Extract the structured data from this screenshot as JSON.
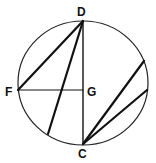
{
  "diagram": {
    "type": "circle-geometry",
    "circle": {
      "cx": 83,
      "cy": 83,
      "rx": 65,
      "ry": 62,
      "stroke": "#222222"
    },
    "points": {
      "D": {
        "x": 83,
        "y": 21,
        "label": "D",
        "lx": 77,
        "ly": 16
      },
      "F": {
        "x": 18,
        "y": 90,
        "label": "F",
        "lx": 5,
        "ly": 96
      },
      "G": {
        "x": 83,
        "y": 90,
        "label": "G",
        "lx": 87,
        "ly": 96
      },
      "C": {
        "x": 83,
        "y": 144,
        "label": "C",
        "lx": 78,
        "ly": 158
      }
    },
    "segments": [
      {
        "name": "segment-DF",
        "x1": 83,
        "y1": 21,
        "x2": 18,
        "y2": 90,
        "width": 2.2
      },
      {
        "name": "segment-D-chord",
        "x1": 83,
        "y1": 21,
        "x2": 48,
        "y2": 134,
        "width": 2.2
      },
      {
        "name": "segment-DC",
        "x1": 83,
        "y1": 21,
        "x2": 83,
        "y2": 144,
        "width": 1.4
      },
      {
        "name": "segment-FG",
        "x1": 18,
        "y1": 90,
        "x2": 83,
        "y2": 90,
        "width": 1.2
      },
      {
        "name": "segment-C-upper-chord",
        "x1": 83,
        "y1": 144,
        "x2": 144,
        "y2": 61,
        "width": 2.2
      },
      {
        "name": "segment-C-lower-chord",
        "x1": 83,
        "y1": 144,
        "x2": 147,
        "y2": 90,
        "width": 2.2
      }
    ]
  }
}
